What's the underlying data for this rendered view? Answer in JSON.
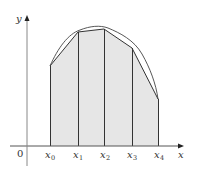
{
  "diagram": {
    "type": "trapezoidal-rule-approximation",
    "axes": {
      "x_label": "x",
      "y_label": "y",
      "origin_label": "0"
    },
    "partition_points": [
      {
        "base": "x",
        "sub": "0"
      },
      {
        "base": "x",
        "sub": "1"
      },
      {
        "base": "x",
        "sub": "2"
      },
      {
        "base": "x",
        "sub": "3"
      },
      {
        "base": "x",
        "sub": "4"
      }
    ],
    "colors": {
      "fill": "#e6e6e6",
      "lines": "#333333",
      "axis": "#555555"
    }
  }
}
